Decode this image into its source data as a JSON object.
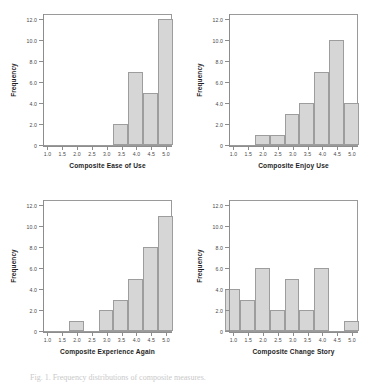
{
  "figure": {
    "caption": "Fig. 1. Frequency distributions of composite measures.",
    "ylabel": "Frequency",
    "bar_color": "#d6d6d6",
    "bar_border_color": "#9d9d9d",
    "axis_color": "#8d8d8d",
    "background": "#ffffff"
  },
  "chart_data": [
    {
      "type": "bar",
      "title": "",
      "xlabel": "Composite Ease of Use",
      "ylabel": "Frequency",
      "categories": [
        "1.0",
        "1.5",
        "2.0",
        "2.5",
        "3.0",
        "3.5",
        "4.0",
        "4.5",
        "5.0"
      ],
      "x": [
        1.0,
        1.5,
        2.0,
        2.5,
        3.0,
        3.5,
        4.0,
        4.5,
        5.0
      ],
      "values": [
        0,
        0,
        0,
        0,
        0,
        2,
        7,
        5,
        12
      ],
      "xticklabels": [
        "1.0",
        "1.5",
        "2.0",
        "2.5",
        "3.0",
        "3.5",
        "4.0",
        "4.5",
        "5.0"
      ],
      "yticklabels": [
        "0",
        "2.0",
        "4.0",
        "6.0",
        "8.0",
        "10.0",
        "12.0"
      ],
      "yticks": [
        0,
        2,
        4,
        6,
        8,
        10,
        12
      ],
      "xlim": [
        0.85,
        5.2
      ],
      "ylim": [
        0,
        12.6
      ],
      "grid": false,
      "legend": "none"
    },
    {
      "type": "bar",
      "title": "",
      "xlabel": "Composite Enjoy Use",
      "ylabel": "Frequency",
      "categories": [
        "1.0",
        "1.5",
        "2.0",
        "2.5",
        "3.0",
        "3.5",
        "4.0",
        "4.5",
        "5.0"
      ],
      "x": [
        1.0,
        1.5,
        2.0,
        2.5,
        3.0,
        3.5,
        4.0,
        4.5,
        5.0
      ],
      "values": [
        0,
        0,
        1,
        1,
        3,
        4,
        7,
        10,
        4
      ],
      "xticklabels": [
        "1.0",
        "1.5",
        "2.0",
        "2.5",
        "3.0",
        "3.5",
        "4.0",
        "4.5",
        "5.0"
      ],
      "yticklabels": [
        "0",
        "2.0",
        "4.0",
        "6.0",
        "8.0",
        "10.0",
        "12.0"
      ],
      "yticks": [
        0,
        2,
        4,
        6,
        8,
        10,
        12
      ],
      "xlim": [
        0.85,
        5.2
      ],
      "ylim": [
        0,
        12.6
      ],
      "grid": false,
      "legend": "none"
    },
    {
      "type": "bar",
      "title": "",
      "xlabel": "Composite Experience Again",
      "ylabel": "Frequency",
      "categories": [
        "1.0",
        "1.5",
        "2.0",
        "2.5",
        "3.0",
        "3.5",
        "4.0",
        "4.5",
        "5.0"
      ],
      "x": [
        1.0,
        1.5,
        2.0,
        2.5,
        3.0,
        3.5,
        4.0,
        4.5,
        5.0
      ],
      "values": [
        0,
        0,
        1,
        0,
        2,
        3,
        5,
        8,
        11
      ],
      "xticklabels": [
        "1.0",
        "1.5",
        "2.0",
        "2.5",
        "3.0",
        "3.5",
        "4.0",
        "4.5",
        "5.0"
      ],
      "yticklabels": [
        "0",
        "2.0",
        "4.0",
        "6.0",
        "8.0",
        "10.0",
        "12.0"
      ],
      "yticks": [
        0,
        2,
        4,
        6,
        8,
        10,
        12
      ],
      "xlim": [
        0.85,
        5.2
      ],
      "ylim": [
        0,
        12.6
      ],
      "grid": false,
      "legend": "none"
    },
    {
      "type": "bar",
      "title": "",
      "xlabel": "Composite Change Story",
      "ylabel": "Frequency",
      "categories": [
        "1.0",
        "1.5",
        "2.0",
        "2.5",
        "3.0",
        "3.5",
        "4.0",
        "4.5",
        "5.0"
      ],
      "x": [
        1.0,
        1.5,
        2.0,
        2.5,
        3.0,
        3.5,
        4.0,
        4.5,
        5.0
      ],
      "values": [
        4,
        3,
        6,
        2,
        5,
        2,
        6,
        0,
        1
      ],
      "xticklabels": [
        "1.0",
        "1.5",
        "2.0",
        "2.5",
        "3.0",
        "3.5",
        "4.0",
        "4.5",
        "5.0"
      ],
      "yticklabels": [
        "0",
        "2.0",
        "4.0",
        "6.0",
        "8.0",
        "10.0",
        "12.0"
      ],
      "yticks": [
        0,
        2,
        4,
        6,
        8,
        10,
        12
      ],
      "xlim": [
        0.85,
        5.2
      ],
      "ylim": [
        0,
        12.6
      ],
      "grid": false,
      "legend": "none"
    }
  ]
}
